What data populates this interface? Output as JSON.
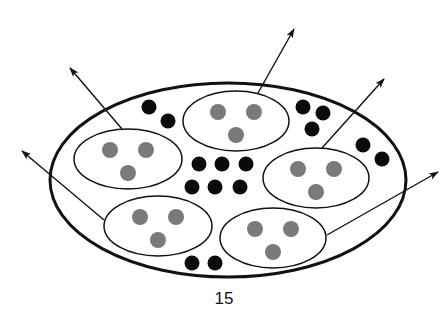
{
  "caption_top": "(cropped caption text — only descenders visible)",
  "page_number": "15",
  "colors": {
    "outline": "#111111",
    "black_dot": "#0a0a0a",
    "gray_dot": "#7a7a7a",
    "background": "#ffffff"
  },
  "outer_cell": {
    "cx": 228,
    "cy": 180,
    "rx": 178,
    "ry": 97,
    "stroke_width": 3
  },
  "vesicles": [
    {
      "id": "top-center",
      "cx": 236,
      "cy": 121,
      "rx": 53,
      "ry": 30
    },
    {
      "id": "left",
      "cx": 128,
      "cy": 159,
      "rx": 54,
      "ry": 30
    },
    {
      "id": "right",
      "cx": 316,
      "cy": 178,
      "rx": 53,
      "ry": 30
    },
    {
      "id": "bottom-left",
      "cx": 158,
      "cy": 226,
      "rx": 54,
      "ry": 30
    },
    {
      "id": "bottom-right",
      "cx": 273,
      "cy": 238,
      "rx": 53,
      "ry": 30
    }
  ],
  "gray_dot_pattern": [
    {
      "dx": -18,
      "dy": -9
    },
    {
      "dx": 18,
      "dy": -9
    },
    {
      "dx": 0,
      "dy": 14
    }
  ],
  "gray_dot_radius": 8,
  "black_dots": [
    {
      "x": 149,
      "y": 107
    },
    {
      "x": 168,
      "y": 121
    },
    {
      "x": 303,
      "y": 107
    },
    {
      "x": 323,
      "y": 113
    },
    {
      "x": 312,
      "y": 129
    },
    {
      "x": 363,
      "y": 145
    },
    {
      "x": 382,
      "y": 159
    },
    {
      "x": 199,
      "y": 164
    },
    {
      "x": 222,
      "y": 164
    },
    {
      "x": 246,
      "y": 164
    },
    {
      "x": 192,
      "y": 187
    },
    {
      "x": 215,
      "y": 187
    },
    {
      "x": 240,
      "y": 187
    },
    {
      "x": 192,
      "y": 263
    },
    {
      "x": 215,
      "y": 263
    }
  ],
  "black_dot_radius": 7.5,
  "arrows": [
    {
      "id": "arrow-top",
      "x1": 258,
      "y1": 93,
      "x2": 294,
      "y2": 29
    },
    {
      "id": "arrow-right-upper",
      "x1": 322,
      "y1": 148,
      "x2": 384,
      "y2": 79
    },
    {
      "id": "arrow-right-lower",
      "x1": 327,
      "y1": 235,
      "x2": 438,
      "y2": 172
    },
    {
      "id": "arrow-top-left",
      "x1": 122,
      "y1": 129,
      "x2": 70,
      "y2": 68
    },
    {
      "id": "arrow-left",
      "x1": 104,
      "y1": 220,
      "x2": 22,
      "y2": 151
    }
  ]
}
